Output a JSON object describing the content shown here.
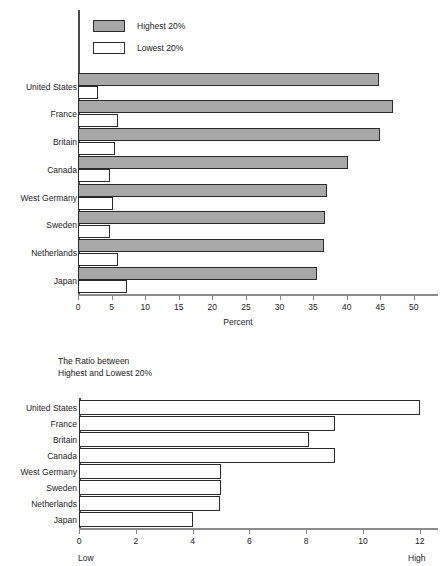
{
  "chart_data": [
    {
      "type": "bar",
      "orientation": "horizontal",
      "id": "income-share-chart",
      "title": "",
      "xlabel": "Percent",
      "ylabel": "",
      "xlim": [
        0,
        53
      ],
      "xticks": [
        0,
        5,
        10,
        15,
        20,
        25,
        30,
        35,
        40,
        45,
        50
      ],
      "xtick_labels": [
        "0",
        "5",
        "10",
        "15",
        "20",
        "25",
        "30",
        "35",
        "40",
        "45",
        "50"
      ],
      "grid": false,
      "legend_position": "top-left",
      "categories": [
        "United States",
        "France",
        "Britain",
        "Canada",
        "West Germany",
        "Sweden",
        "Netherlands",
        "Japan"
      ],
      "series": [
        {
          "name": "Highest 20%",
          "color": "#a8a8a8",
          "values": [
            44.8,
            46.9,
            44.9,
            40.2,
            37.1,
            36.8,
            36.6,
            35.5
          ]
        },
        {
          "name": "Lowest 20%",
          "color": "#ffffff",
          "values": [
            3.0,
            6.0,
            5.5,
            4.7,
            5.2,
            4.7,
            5.9,
            7.3
          ]
        }
      ]
    },
    {
      "type": "bar",
      "orientation": "horizontal",
      "id": "ratio-chart",
      "title": "The Ratio between\nHighest and Lowest 20%",
      "title_line1": "The Ratio between",
      "title_line2": "Highest and Lowest 20%",
      "xlabel": "",
      "ylabel": "",
      "xlim": [
        0,
        12.5
      ],
      "xticks": [
        0,
        2,
        4,
        6,
        8,
        10,
        12
      ],
      "xtick_labels": [
        "0",
        "2",
        "4",
        "6",
        "8",
        "10",
        "12"
      ],
      "grid": false,
      "axis_end_labels": {
        "left": "Low",
        "right": "High"
      },
      "categories": [
        "United States",
        "France",
        "Britain",
        "Canada",
        "West Germany",
        "Sweden",
        "Netherlands",
        "Japan"
      ],
      "series": [
        {
          "name": "Ratio",
          "color": "#ffffff",
          "values": [
            12.0,
            9.0,
            8.1,
            9.0,
            5.0,
            5.0,
            4.95,
            4.0
          ]
        }
      ]
    }
  ],
  "top_chart": {
    "legend": [
      {
        "label": "Highest 20%",
        "swatch": "high"
      },
      {
        "label": "Lowest 20%",
        "swatch": "low"
      }
    ],
    "categories": [
      "United States",
      "France",
      "Britain",
      "Canada",
      "West Germany",
      "Sweden",
      "Netherlands",
      "Japan"
    ],
    "xtick_labels": [
      "0",
      "5",
      "10",
      "15",
      "20",
      "25",
      "30",
      "35",
      "40",
      "45",
      "50"
    ],
    "axis_title": "Percent"
  },
  "bottom_chart": {
    "title_line1": "The Ratio between",
    "title_line2": "Highest and Lowest 20%",
    "categories": [
      "United States",
      "France",
      "Britain",
      "Canada",
      "West Germany",
      "Sweden",
      "Netherlands",
      "Japan"
    ],
    "xtick_labels": [
      "0",
      "2",
      "4",
      "6",
      "8",
      "10",
      "12"
    ],
    "low_label": "Low",
    "high_label": "High"
  }
}
